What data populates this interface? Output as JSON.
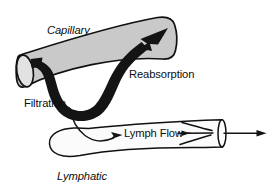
{
  "diagram": {
    "background_color": "#ffffff",
    "line_color": "#141414",
    "capillary_fill": "#c9c9c9",
    "lymphatic_fill": "#fbfbfb",
    "labels": {
      "capillary": "Capillary",
      "reabsorption": "Reabsorption",
      "filtration": "Filtration",
      "lymph_flow": "Lymph Flow",
      "lymphatic": "Lymphatic"
    },
    "structures": [
      {
        "name": "capillary",
        "label": "Capillary",
        "label_style": "italic",
        "fill": "#c9c9c9",
        "open_end": "left",
        "flow_direction": "right"
      },
      {
        "name": "lymphatic",
        "label": "Lymphatic",
        "label_style": "italic",
        "fill": "#fbfbfb",
        "closed_end": "left",
        "open_end": "right",
        "flow_direction": "right",
        "has_valves": true
      }
    ],
    "flows": [
      {
        "name": "filtration",
        "label": "Filtration",
        "label_style": "upright",
        "stroke": "thick",
        "direction": "out-of-capillary"
      },
      {
        "name": "reabsorption",
        "label": "Reabsorption",
        "label_style": "upright",
        "stroke": "thick",
        "direction": "into-capillary"
      },
      {
        "name": "lymph-uptake",
        "label": "",
        "stroke": "thin",
        "direction": "into-lymphatic"
      },
      {
        "name": "lymph-flow",
        "label": "Lymph Flow",
        "label_style": "upright",
        "stroke": "thin",
        "direction": "right"
      }
    ]
  }
}
